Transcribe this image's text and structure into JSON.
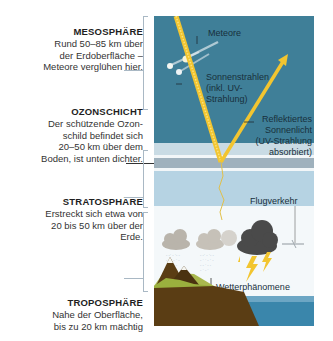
{
  "layers": [
    {
      "id": "mesosphere",
      "title": "MESOSPHÄRE",
      "lines": [
        "Rund 50–85 km über",
        "der Erdoberfläche –",
        "Meteore verglühen hier."
      ]
    },
    {
      "id": "ozone",
      "title": "OZONSCHICHT",
      "lines": [
        "Der schützende Ozon-",
        "schild befindet sich",
        "20–50 km über dem",
        "Boden, ist unten dichter."
      ]
    },
    {
      "id": "stratosphere",
      "title": "STRATOSPHÄRE",
      "lines": [
        "Erstreckt sich etwa von",
        "20 bis 50 km über der",
        "Erde."
      ]
    },
    {
      "id": "troposphere",
      "title": "TROPOSPHÄRE",
      "lines": [
        "Nahe der Oberfläche,",
        "bis zu 20 km mächtig"
      ]
    }
  ],
  "illustration": {
    "meteors_label": "Meteore",
    "sunrays_label": [
      "Sonnenstrahlen",
      "(inkl. UV-",
      "Strahlung)"
    ],
    "reflected_label": [
      "Reflektiertes",
      "Sonnenlicht",
      "(UV-Strahlung",
      "absorbiert)"
    ],
    "air_traffic_label": "Flugverkehr",
    "weather_label": "Wetterphänomene"
  },
  "colors": {
    "mesosphere": "#3f7f98",
    "ozone_band": "#c9dbe4",
    "stratosphere": "#b6d3e3",
    "troposphere": "#f4f8fa",
    "sunray": "#f2c530",
    "earth": "#5a3d14",
    "grass": "#a9b84e",
    "ocean": "#3a86ab",
    "storm_cloud": "#4a4a4a",
    "rain_cloud": "#b9b4ab",
    "bracket": "#a9b8c4"
  }
}
